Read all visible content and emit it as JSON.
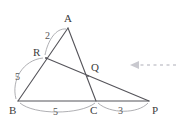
{
  "figure": {
    "kind": "geometry-diagram",
    "background_color": "#ffffff",
    "line_color": "#55545a",
    "arc_color": "#9a9aa0",
    "label_color": "#3c3c3c",
    "arrow_color": "#c9c9cf"
  },
  "vertices": [
    {
      "id": "A",
      "label": "A",
      "x": 68,
      "y": 28,
      "label_x": 64,
      "label_y": 13
    },
    {
      "id": "R",
      "label": "R",
      "x": 46,
      "y": 58,
      "label_x": 33,
      "label_y": 47
    },
    {
      "id": "Q",
      "label": "Q",
      "x": 88,
      "y": 76,
      "label_x": 91,
      "label_y": 62
    },
    {
      "id": "B",
      "label": "B",
      "x": 18,
      "y": 101,
      "label_x": 9,
      "label_y": 105
    },
    {
      "id": "C",
      "label": "C",
      "x": 96,
      "y": 101,
      "label_x": 90,
      "label_y": 105
    },
    {
      "id": "P",
      "label": "P",
      "x": 149,
      "y": 101,
      "label_x": 152,
      "label_y": 105
    }
  ],
  "segments": [
    {
      "name": "segment-B-A",
      "from": "B",
      "to": "A"
    },
    {
      "name": "segment-A-C",
      "from": "A",
      "to": "C"
    },
    {
      "name": "segment-B-P",
      "from": "B",
      "to": "P"
    },
    {
      "name": "segment-R-P",
      "from": "R",
      "to": "P"
    }
  ],
  "measures": [
    {
      "name": "measure-A-R",
      "value": "2",
      "x": 45,
      "y": 31,
      "between": "A-R"
    },
    {
      "name": "measure-R-B",
      "value": "5",
      "x": 15,
      "y": 72,
      "between": "R-B"
    },
    {
      "name": "measure-B-C",
      "value": "5",
      "x": 53,
      "y": 107,
      "between": "B-C"
    },
    {
      "name": "measure-C-P",
      "value": "3",
      "x": 118,
      "y": 106,
      "between": "C-P"
    }
  ],
  "annotation_arrow": {
    "name": "pointer-arrow",
    "direction": "left",
    "tip_x": 131,
    "tip_y": 65,
    "tail_x": 176,
    "tail_y": 65,
    "style": "dashed"
  }
}
